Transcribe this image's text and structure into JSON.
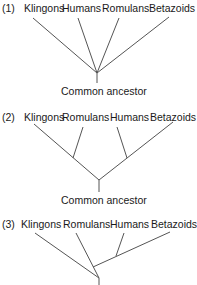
{
  "trees": [
    {
      "number": "(1)",
      "taxa": [
        "Klingons",
        "Humans",
        "Romulans",
        "Betazoids"
      ],
      "root_label": "Common ancestor",
      "topology": "polytomy: all four taxa branch from a single common ancestor node"
    },
    {
      "number": "(2)",
      "taxa": [
        "Klingons",
        "Romulans",
        "Humans",
        "Betazoids"
      ],
      "root_label": "Common ancestor",
      "topology": "((Klingons, Romulans), (Humans, Betazoids))"
    },
    {
      "number": "(3)",
      "taxa": [
        "Klingons",
        "Romulans",
        "Humans",
        "Betazoids"
      ],
      "root_label": "",
      "topology": "(Klingons, (Romulans, (Humans, Betazoids)))"
    }
  ],
  "line_color": "#555555"
}
